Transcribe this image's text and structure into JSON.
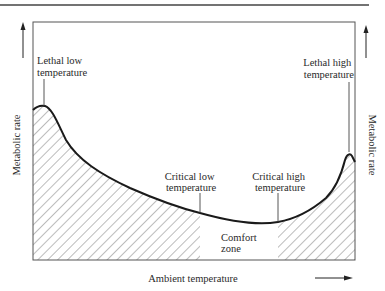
{
  "diagram": {
    "y_axis_label_left": "Metabolic rate",
    "y_axis_label_right": "Metabolic rate",
    "x_axis_label": "Ambient temperature",
    "annotations": {
      "lethal_low": [
        "Lethal low",
        "temperature"
      ],
      "lethal_high": [
        "Lethal high",
        "temperature"
      ],
      "critical_low": [
        "Critical low",
        "temperature"
      ],
      "critical_high": [
        "Critical high",
        "temperature"
      ],
      "comfort_zone": [
        "Comfort",
        "zone"
      ]
    },
    "colors": {
      "line": "#1a1a1a",
      "frame": "#555555",
      "hatch": "#6a6a6a",
      "text": "#2a2a2a"
    }
  }
}
